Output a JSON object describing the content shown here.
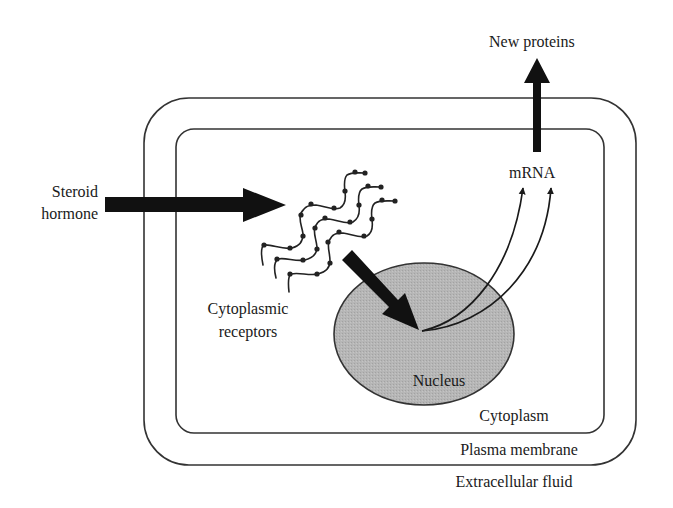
{
  "diagram": {
    "labels": {
      "steroid_hormone_line1": "Steroid",
      "steroid_hormone_line2": "hormone",
      "cytoplasmic_receptors_line1": "Cytoplasmic",
      "cytoplasmic_receptors_line2": "receptors",
      "nucleus": "Nucleus",
      "mrna": "mRNA",
      "new_proteins": "New proteins",
      "cytoplasm": "Cytoplasm",
      "plasma_membrane": "Plasma membrane",
      "extracellular_fluid": "Extracellular fluid"
    },
    "colors": {
      "arrow": "#111111",
      "nucleus_fill": "#b3b3b3",
      "nucleus_stroke": "#333333",
      "membrane_stroke": "#333333",
      "background": "#ffffff"
    },
    "arrows": [
      {
        "from": "Steroid hormone",
        "to": "Cytoplasmic receptors",
        "style": "thick"
      },
      {
        "from": "Cytoplasmic receptors",
        "to": "Nucleus",
        "style": "thick"
      },
      {
        "from": "Nucleus",
        "to": "mRNA",
        "style": "thin-curved",
        "count": 2
      },
      {
        "from": "mRNA",
        "to": "New proteins",
        "style": "thick"
      }
    ]
  }
}
